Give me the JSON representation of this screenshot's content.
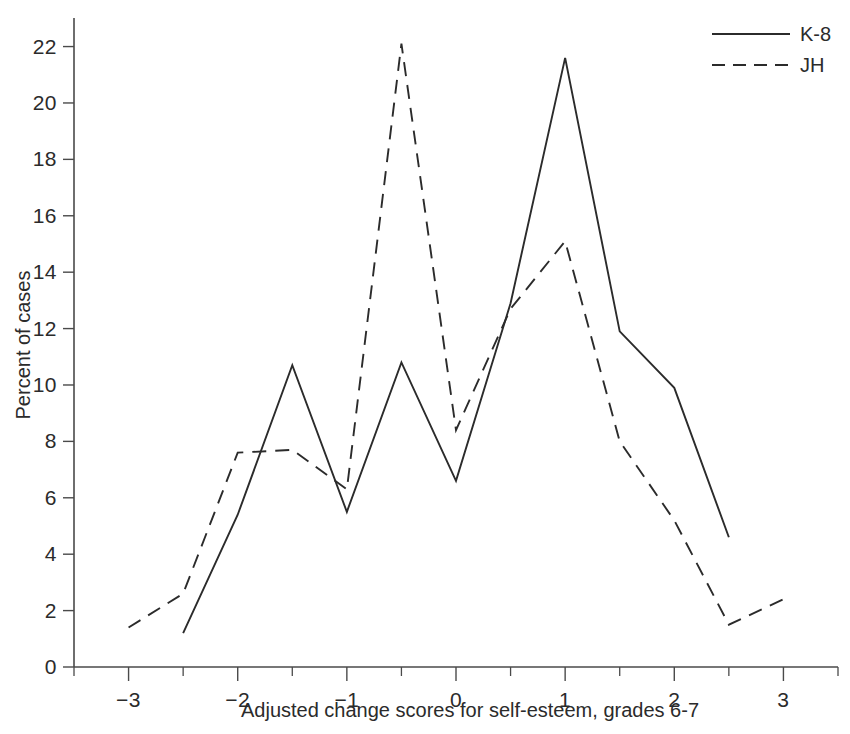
{
  "chart_data": {
    "type": "line",
    "title": "",
    "xlabel": "Adjusted change scores for self-esteem, grades 6-7",
    "ylabel": "Percent of cases",
    "xlim": [
      -3.5,
      3.5
    ],
    "ylim": [
      0,
      22.8
    ],
    "grid": false,
    "legend_position": "top-right",
    "x_ticks": [
      -3,
      -2,
      -1,
      0,
      1,
      2,
      3
    ],
    "x_tick_labels": [
      "−3",
      "−2",
      "−1",
      "0",
      "1",
      "2",
      "3"
    ],
    "x_minor_ticks": [
      -3.5,
      -2.5,
      -1.5,
      -0.5,
      0.5,
      1.5,
      2.5,
      3.5
    ],
    "y_ticks": [
      0,
      2,
      4,
      6,
      8,
      10,
      12,
      14,
      16,
      18,
      20,
      22
    ],
    "y_tick_labels": [
      "0",
      "2",
      "4",
      "6",
      "8",
      "10",
      "12",
      "14",
      "16",
      "18",
      "20",
      "22"
    ],
    "series": [
      {
        "name": "K-8",
        "style": "solid",
        "x": [
          -2.5,
          -2,
          -1.5,
          -1,
          -0.5,
          0,
          0.5,
          1,
          1.5,
          2,
          2.5
        ],
        "values": [
          1.2,
          5.4,
          10.7,
          5.5,
          10.8,
          6.6,
          12.9,
          21.6,
          11.9,
          9.9,
          4.6
        ]
      },
      {
        "name": "JH",
        "style": "dashed",
        "x": [
          -3,
          -2.5,
          -2,
          -1.5,
          -1,
          -0.5,
          0,
          0.5,
          1,
          1.5,
          2,
          2.5,
          3
        ],
        "values": [
          1.4,
          2.6,
          7.6,
          7.7,
          6.3,
          22.1,
          8.4,
          12.7,
          15.1,
          8.0,
          5.2,
          1.5,
          2.4
        ]
      }
    ]
  },
  "legend": {
    "entries": [
      {
        "label": "K-8",
        "style": "solid"
      },
      {
        "label": "JH",
        "style": "dashed"
      }
    ]
  }
}
